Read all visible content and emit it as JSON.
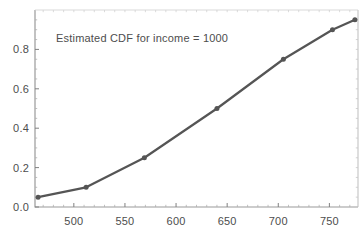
{
  "chart_data": {
    "type": "line",
    "title": "Estimated CDF for income = 1000",
    "xlabel": "",
    "ylabel": "",
    "x": [
      465,
      512,
      569,
      640,
      705,
      753,
      775
    ],
    "values": [
      0.05,
      0.1,
      0.25,
      0.5,
      0.75,
      0.9,
      0.95
    ],
    "series": [
      {
        "name": "Estimated CDF",
        "x": [
          465,
          512,
          569,
          640,
          705,
          753,
          775
        ],
        "values": [
          0.05,
          0.1,
          0.25,
          0.5,
          0.75,
          0.9,
          0.95
        ]
      }
    ],
    "xlim": [
      462,
      778
    ],
    "ylim": [
      0.0,
      1.0
    ],
    "x_ticks": [
      500,
      550,
      600,
      650,
      700,
      750
    ],
    "x_tick_labels": [
      "500",
      "550",
      "600",
      "650",
      "700",
      "750"
    ],
    "y_ticks": [
      0.0,
      0.2,
      0.4,
      0.6,
      0.8
    ],
    "y_tick_labels": [
      "0.0",
      "0.2",
      "0.4",
      "0.6",
      "0.8"
    ],
    "x_minor_ticks": [
      470,
      480,
      490,
      510,
      520,
      530,
      540,
      560,
      570,
      580,
      590,
      610,
      620,
      630,
      640,
      660,
      670,
      680,
      690,
      710,
      720,
      730,
      740,
      760,
      770
    ],
    "y_minor_ticks": [
      0.05,
      0.1,
      0.15,
      0.25,
      0.3,
      0.35,
      0.45,
      0.5,
      0.55,
      0.65,
      0.7,
      0.75,
      0.85,
      0.9,
      0.95
    ],
    "grid": false,
    "legend": "none",
    "line_color": "#555555",
    "marker_color": "#555555",
    "frame_color": "#999999",
    "marker_style": "circle",
    "marker_size": 5,
    "line_width": 2
  }
}
